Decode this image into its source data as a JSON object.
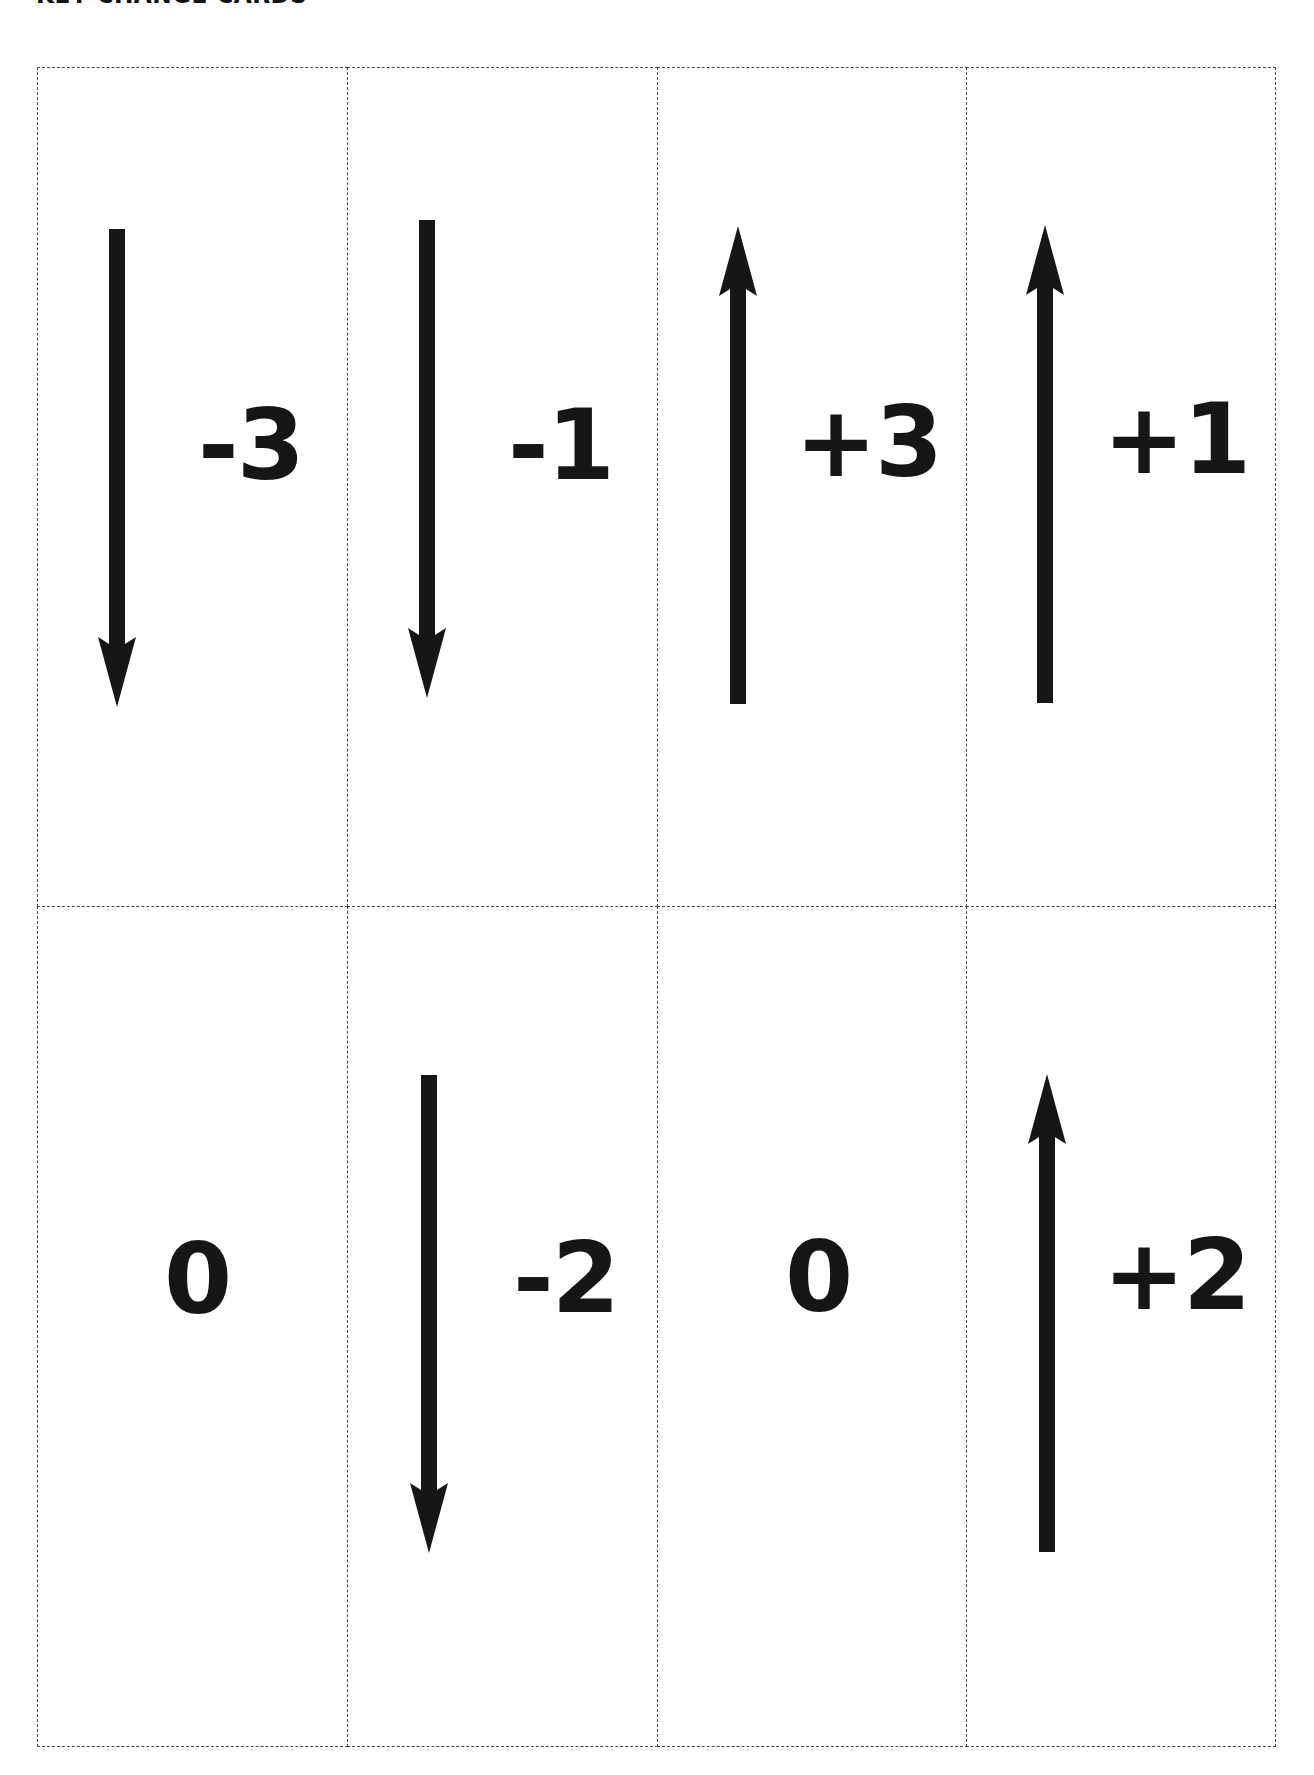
{
  "page": {
    "title": "KEY CHANGE CARDS"
  },
  "colors": {
    "ink": "#161616",
    "cut_line": "#4a4a4a",
    "paper": "#ffffff"
  },
  "cards": [
    {
      "value": "-3",
      "arrow": "down",
      "row": 1,
      "col": 1
    },
    {
      "value": "-1",
      "arrow": "down",
      "row": 1,
      "col": 2
    },
    {
      "value": "+3",
      "arrow": "up",
      "row": 1,
      "col": 3
    },
    {
      "value": "+1",
      "arrow": "up",
      "row": 1,
      "col": 4
    },
    {
      "value": "0",
      "arrow": "none",
      "row": 2,
      "col": 1
    },
    {
      "value": "-2",
      "arrow": "down",
      "row": 2,
      "col": 2
    },
    {
      "value": "0",
      "arrow": "none",
      "row": 2,
      "col": 3
    },
    {
      "value": "+2",
      "arrow": "up",
      "row": 2,
      "col": 4
    }
  ]
}
